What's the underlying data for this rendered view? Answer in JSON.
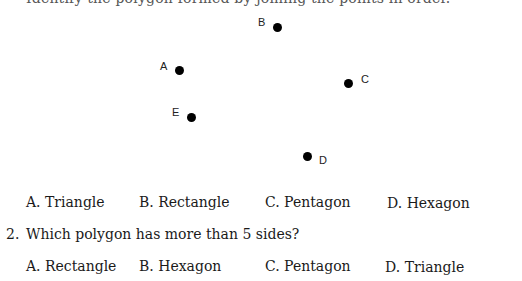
{
  "previous_question": {
    "clipped_text": "Identify the polygon formed by joining the points in order."
  },
  "figure": {
    "points": [
      {
        "label": "B",
        "dot_x": 273,
        "dot_y": 23,
        "label_x": 258,
        "label_y": 17
      },
      {
        "label": "A",
        "dot_x": 175,
        "dot_y": 66,
        "label_x": 160,
        "label_y": 61
      },
      {
        "label": "C",
        "dot_x": 344,
        "dot_y": 79,
        "label_x": 361,
        "label_y": 74
      },
      {
        "label": "E",
        "dot_x": 187,
        "dot_y": 113,
        "label_x": 172,
        "label_y": 107
      },
      {
        "label": "D",
        "dot_x": 303,
        "dot_y": 152,
        "label_x": 319,
        "label_y": 155
      }
    ]
  },
  "question1_options": [
    {
      "text": "A. Triangle"
    },
    {
      "text": "B. Rectangle"
    },
    {
      "text": "C. Pentagon"
    },
    {
      "text": "D. Hexagon"
    }
  ],
  "question2": {
    "number": "2.",
    "text": "Which polygon has more than 5 sides?",
    "options": [
      {
        "text": "A. Rectangle"
      },
      {
        "text": "B. Hexagon"
      },
      {
        "text": "C. Pentagon"
      },
      {
        "text": "D. Triangle"
      }
    ]
  }
}
